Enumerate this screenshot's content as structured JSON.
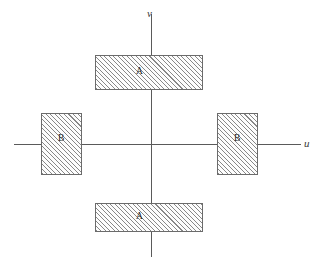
{
  "figure": {
    "width": 319,
    "height": 264,
    "background": "#ffffff",
    "axis_color": "#5a5a5a",
    "hatch_color": "#888888",
    "region_border_color": "#6b6b6b"
  },
  "axes": {
    "horizontal": {
      "name": "u-axis",
      "label": "u",
      "label_x": 304,
      "label_y": 138,
      "line_x": 14,
      "line_y": 144,
      "line_length": 287,
      "orientation": "horizontal"
    },
    "vertical": {
      "name": "v-axis",
      "label": "v",
      "label_x": 147,
      "label_y": 8,
      "line_x": 151,
      "line_y": 14,
      "line_length": 243,
      "orientation": "vertical"
    },
    "origin": {
      "x": 151,
      "y": 144
    }
  },
  "regions": [
    {
      "id": "region-a-top",
      "label": "A",
      "x": 95,
      "y": 55,
      "width": 108,
      "height": 35,
      "label_x": 136,
      "label_y": 67,
      "quadrant": "top-center",
      "fill": "hatched"
    },
    {
      "id": "region-b-left",
      "label": "B",
      "x": 41,
      "y": 113,
      "width": 41,
      "height": 62,
      "label_x": 58,
      "label_y": 134,
      "quadrant": "left-center",
      "fill": "hatched"
    },
    {
      "id": "region-b-right",
      "label": "B",
      "x": 217,
      "y": 113,
      "width": 41,
      "height": 62,
      "label_x": 234,
      "label_y": 134,
      "quadrant": "right-center",
      "fill": "hatched"
    },
    {
      "id": "region-a-bottom",
      "label": "A",
      "x": 95,
      "y": 203,
      "width": 108,
      "height": 29,
      "label_x": 136,
      "label_y": 212,
      "quadrant": "bottom-center",
      "fill": "hatched"
    }
  ]
}
